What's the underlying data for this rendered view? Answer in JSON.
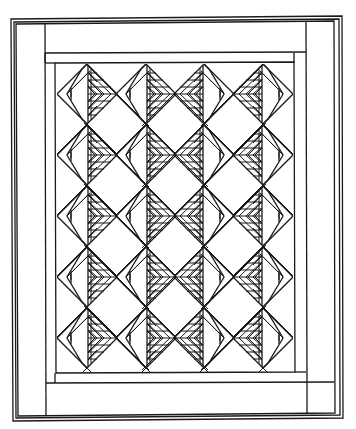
{
  "diagram": {
    "colors": {
      "line": "#1a1a1a",
      "background": "#ffffff"
    },
    "frame": {
      "outer_lines": [
        {
          "x1": 11,
          "y1": 19,
          "x2": 342,
          "y2": 16,
          "x3": 343,
          "y3": 418,
          "x4": 13,
          "y4": 421
        },
        {
          "x1": 14,
          "y1": 22,
          "x2": 339,
          "y2": 19,
          "x3": 340,
          "y3": 415,
          "x4": 16,
          "y4": 418
        },
        {
          "x1": 16,
          "y1": 24,
          "x2": 334,
          "y2": 21,
          "x3": 335,
          "y3": 413,
          "x4": 18,
          "y4": 416
        }
      ],
      "border_strips": {
        "left_strip_inner_x": 45,
        "top_strip_inner_y": 53,
        "right_strip_inner_x": 306,
        "bottom_strip_inner_y": 383,
        "second_border": {
          "left": 55,
          "top": 63,
          "right": 294,
          "bottom": 372
        },
        "inner_field": {
          "left": 57,
          "top": 64,
          "right": 293,
          "bottom": 372
        }
      }
    },
    "blocks": {
      "columns": 4,
      "rows": 5,
      "column_centers_x": [
        87,
        146,
        204,
        263
      ],
      "row_centers_y": [
        94,
        155,
        216,
        277,
        338
      ],
      "half_diagonal": 30,
      "orientation_by_column": [
        "left",
        "left",
        "right",
        "right"
      ]
    }
  }
}
